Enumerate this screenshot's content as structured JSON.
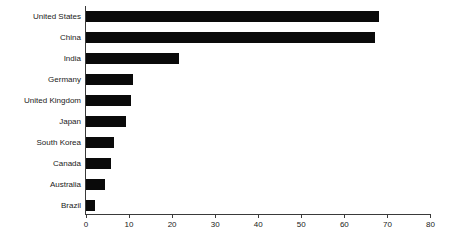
{
  "chart_data": {
    "type": "bar",
    "orientation": "horizontal",
    "title": "",
    "xlabel": "",
    "ylabel": "",
    "categories": [
      "United States",
      "China",
      "India",
      "Germany",
      "United Kingdom",
      "Japan",
      "South Korea",
      "Canada",
      "Australia",
      "Brazil"
    ],
    "values": [
      68,
      67,
      21.5,
      11,
      10.5,
      9.2,
      6.4,
      5.9,
      4.3,
      2.2
    ],
    "xlim": [
      0,
      80
    ],
    "x_ticks": [
      0,
      10,
      20,
      30,
      40,
      50,
      60,
      70,
      80
    ],
    "grid": false,
    "legend": null,
    "bar_color": "#0a0a0a",
    "axis_color": "#3a3a3a",
    "text_color": "#1a1a1a",
    "background_color": "#ffffff"
  }
}
